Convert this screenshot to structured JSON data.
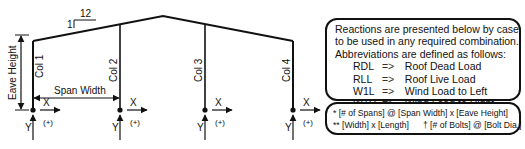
{
  "diagram": {
    "slope": {
      "rise": "1",
      "run": "12"
    },
    "eave_height_label": "Eave Height",
    "span_width_label": "Span Width",
    "columns": [
      {
        "label": "Col 1"
      },
      {
        "label": "Col 2"
      },
      {
        "label": "Col 3"
      },
      {
        "label": "Col 4"
      }
    ],
    "axis": {
      "x_label": "X",
      "y_label": "Y",
      "positive_label": "(+)"
    },
    "colors": {
      "line": "#111111",
      "background": "#ffffff"
    }
  },
  "notes": {
    "intro_lines": [
      "Reactions are presented below by case",
      "to be used in any required combination.",
      "Abbreviations are defined as follows:"
    ],
    "abbreviations": [
      {
        "code": "RDL",
        "arrow": "=>",
        "meaning": "Roof Dead Load"
      },
      {
        "code": "RLL",
        "arrow": "=>",
        "meaning": "Roof Live Load"
      },
      {
        "code": "W1L",
        "arrow": "=>",
        "meaning": "Wind Load to Left"
      },
      {
        "code": "W1R",
        "arrow": "=>",
        "meaning": "Wind Load to Right"
      }
    ]
  },
  "legend": {
    "line1": "* [# of Spans] @ [Span Width] x [Eave Height]",
    "line2a": "** [Width] x [Length]",
    "line2b": "† [# of Bolts] @ [Bolt Dia.]"
  }
}
